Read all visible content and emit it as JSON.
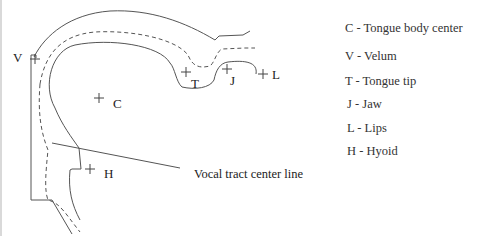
{
  "diagram": {
    "markers": [
      {
        "key": "V",
        "x": 31,
        "y": 59
      },
      {
        "key": "C",
        "x": 99,
        "y": 99
      },
      {
        "key": "T",
        "x": 186,
        "y": 71
      },
      {
        "key": "J",
        "x": 226,
        "y": 68
      },
      {
        "key": "L",
        "x": 263,
        "y": 73
      },
      {
        "key": "H",
        "x": 90,
        "y": 168
      }
    ],
    "labels": {
      "V": "V",
      "C": "C",
      "T": "T",
      "J": "J",
      "L": "L",
      "H": "H"
    },
    "annotation": "Vocal tract center line",
    "colors": {
      "line": "#555555",
      "text": "#222222"
    }
  },
  "legend": {
    "items": [
      {
        "key": "C",
        "text": "C - Tongue body center"
      },
      {
        "key": "V",
        "text": "V - Velum"
      },
      {
        "key": "T",
        "text": "T  - Tongue tip"
      },
      {
        "key": "J",
        "text": " J  - Jaw"
      },
      {
        "key": "L",
        "text": " L  - Lips"
      },
      {
        "key": "H",
        "text": " H  - Hyoid"
      }
    ]
  }
}
